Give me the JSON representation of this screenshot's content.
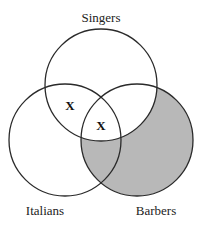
{
  "diagram": {
    "type": "venn",
    "sets": [
      {
        "id": "singers",
        "label": "Singers",
        "cx": 101,
        "cy": 85,
        "r": 56
      },
      {
        "id": "italians",
        "label": "Italians",
        "cx": 65,
        "cy": 140,
        "r": 56
      },
      {
        "id": "barbers",
        "label": "Barbers",
        "cx": 137,
        "cy": 140,
        "r": 56
      }
    ],
    "shaded_regions": [
      "barbers-not-singers"
    ],
    "shade_color": "#b8b8b8",
    "stroke_color": "#2a2a2a",
    "marks": [
      {
        "symbol": "X",
        "region": "singers-and-italians-not-barbers"
      },
      {
        "symbol": "X",
        "region": "singers-and-italians-and-barbers"
      }
    ]
  }
}
